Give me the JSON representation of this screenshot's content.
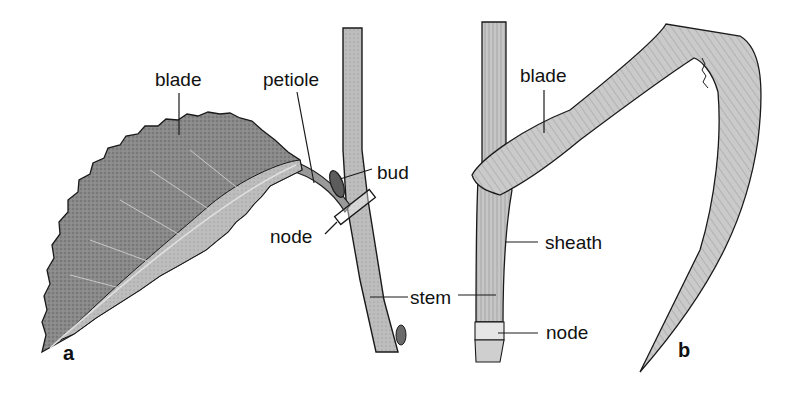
{
  "figure": {
    "panel_a": {
      "letter": "a",
      "labels": {
        "blade": "blade",
        "petiole": "petiole",
        "bud": "bud",
        "node": "node",
        "stem": "stem"
      }
    },
    "panel_b": {
      "letter": "b",
      "labels": {
        "blade": "blade",
        "sheath": "sheath",
        "node": "node"
      }
    },
    "colors": {
      "ink": "#1a1a1a",
      "leaf_dark": "#7a7a7a",
      "leaf_light": "#b8b8b8",
      "stem": "#a8a8a8",
      "grass": "#c4c4c4"
    }
  }
}
